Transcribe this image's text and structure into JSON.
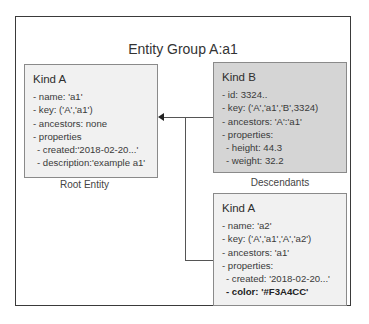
{
  "diagram": {
    "title": "Entity Group A:a1",
    "root_entity": {
      "kind": "Kind A",
      "lines": [
        "- name: 'a1'",
        "- key: ('A','a1')",
        "- ancestors: none",
        "- properties"
      ],
      "properties": [
        "- created:'2018-02-20...'",
        "- description:'example a1'"
      ],
      "caption": "Root Entity"
    },
    "descendant_b": {
      "kind": "Kind B",
      "lines": [
        "- id: 3324..",
        "- key: ('A','a1','B',3324)",
        "- ancestors: 'A':'a1'",
        "- properties:"
      ],
      "properties": [
        "- height: 44.3",
        "- weight: 32.2"
      ]
    },
    "descendants_caption": "Descendants",
    "descendant_a": {
      "kind": "Kind A",
      "lines": [
        "- name: 'a2'",
        "- key: ('A','a1','A','a2')",
        "- ancestors: 'a1'",
        "- properties:"
      ],
      "properties": [
        "- created: '2018-02-20...'"
      ],
      "highlight_property": "- color: '#F3A4CC'"
    },
    "colors": {
      "root_fill": "#f1f1f1",
      "kind_b_fill": "#d5d5d5",
      "child_fill": "#f1f1f1",
      "border": "#8a8a8a",
      "group_border": "#3a3a3a"
    }
  }
}
